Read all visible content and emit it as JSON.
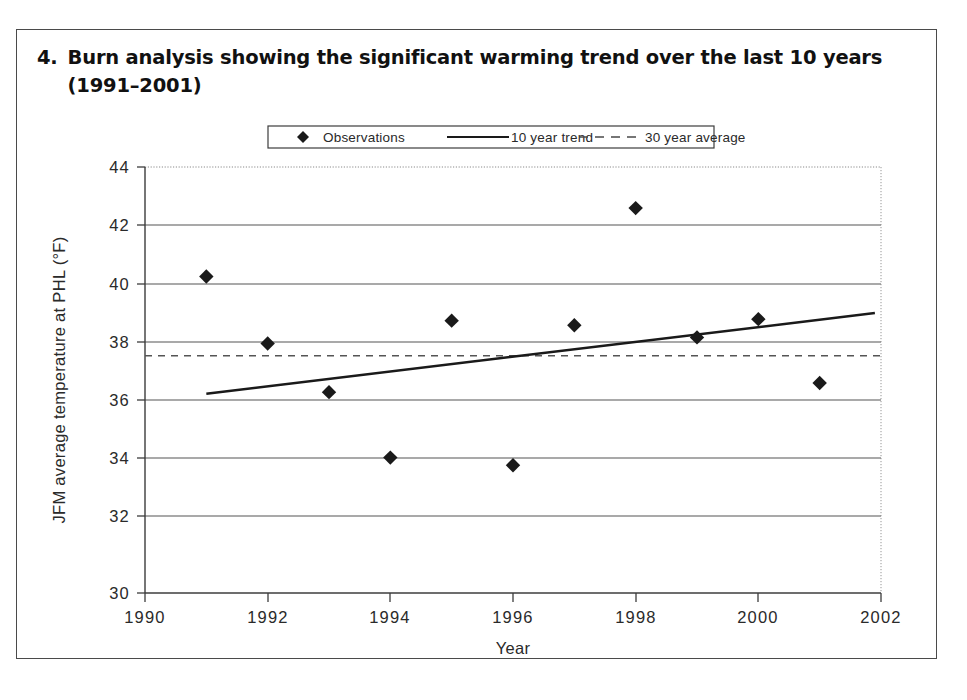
{
  "caption": {
    "number": "4.",
    "text": "Burn analysis showing the significant warming trend over the last 10 years (1991–2001)"
  },
  "chart_data": {
    "type": "scatter",
    "title": "",
    "xlabel": "Year",
    "ylabel": "JFM average temperature at PHL (°F)",
    "xlim": [
      1990,
      2002
    ],
    "ylim": [
      30,
      44
    ],
    "xticks": [
      "1990",
      "1992",
      "1994",
      "1996",
      "1998",
      "2000",
      "2002"
    ],
    "xtick_values": [
      1990,
      1992,
      1994,
      1996,
      1998,
      2000,
      2002
    ],
    "yticks": [
      "30",
      "32",
      "34",
      "36",
      "38",
      "40",
      "42",
      "44"
    ],
    "ytick_values": [
      30,
      32,
      34,
      36,
      38,
      40,
      42,
      44
    ],
    "grid": "horizontal",
    "legend_position": "top-center",
    "series": [
      {
        "name": "Observations",
        "type": "scatter",
        "marker": "diamond",
        "color": "#1a1a1a",
        "x": [
          1991,
          1992,
          1993,
          1994,
          1995,
          1996,
          1997,
          1998,
          1999,
          2000,
          2001
        ],
        "values": [
          40.4,
          38.2,
          36.6,
          34.45,
          38.95,
          34.2,
          38.8,
          42.65,
          38.4,
          39.0,
          36.9
        ]
      },
      {
        "name": "10 year trend",
        "type": "line",
        "style": "solid",
        "color": "#1a1a1a",
        "x": [
          1991,
          2001.9
        ],
        "values": [
          36.55,
          39.2
        ]
      },
      {
        "name": "30 year average",
        "type": "line",
        "style": "dashed",
        "color": "#555555",
        "value": 37.8
      }
    ]
  },
  "legend": {
    "items": [
      {
        "label": "Observations",
        "marker": "diamond"
      },
      {
        "label": "10 year trend",
        "marker": "solid-line"
      },
      {
        "label": "30 year average",
        "marker": "dashed-line"
      }
    ]
  }
}
